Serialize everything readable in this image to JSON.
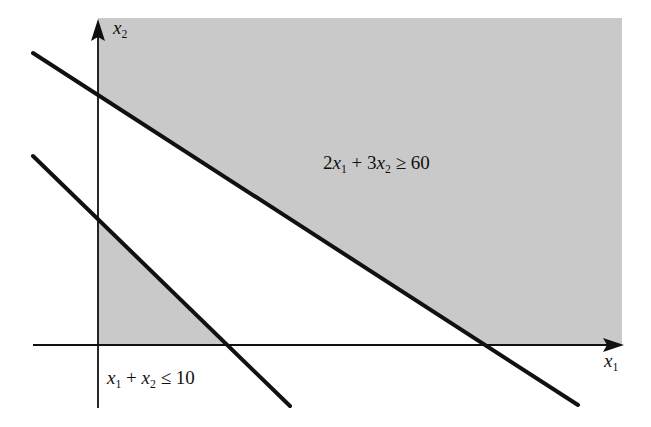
{
  "diagram": {
    "type": "feasible-region-plot",
    "axes": {
      "x_label_var": "x",
      "x_label_sub": "1",
      "y_label_var": "x",
      "y_label_sub": "2"
    },
    "constraints": [
      {
        "id": "c1",
        "text_parts": [
          "2",
          "x",
          "1",
          " + 3",
          "x",
          "2",
          " ≥ 60"
        ],
        "full_text": "2x1 + 3x2 ≥ 60",
        "shaded_side": "above"
      },
      {
        "id": "c2",
        "text_parts": [
          "x",
          "1",
          " + ",
          "x",
          "2",
          " ≤ 10"
        ],
        "full_text": "x1 + x2 ≤ 10",
        "shaded_side": "below"
      }
    ],
    "colors": {
      "shade": "#c9c9c9",
      "line": "#111111",
      "background": "#ffffff"
    }
  }
}
